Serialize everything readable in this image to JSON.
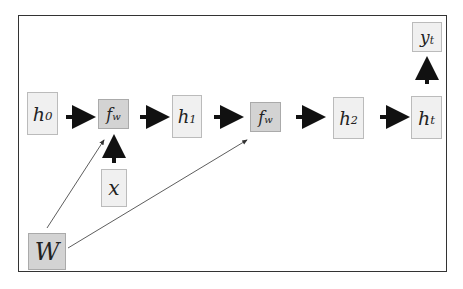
{
  "diagram": {
    "colors": {
      "frame": "#333333",
      "light_node": "#f0f0f0",
      "dark_node": "#d3d3d3",
      "arrow": "#111111"
    },
    "nodes": {
      "h0": {
        "base": "h",
        "sub": "0"
      },
      "fw1": {
        "base": "f",
        "sub": "w"
      },
      "h1": {
        "base": "h",
        "sub": "1"
      },
      "fw2": {
        "base": "f",
        "sub": "w"
      },
      "h2": {
        "base": "h",
        "sub": "2"
      },
      "ht": {
        "base": "h",
        "sub": "t"
      },
      "yt": {
        "base": "y",
        "sub": "t"
      },
      "x": {
        "base": "x",
        "sub": ""
      },
      "W": {
        "base": "W",
        "sub": ""
      }
    },
    "edges": [
      {
        "from": "h0",
        "to": "fw1",
        "style": "thick"
      },
      {
        "from": "fw1",
        "to": "h1",
        "style": "thick"
      },
      {
        "from": "h1",
        "to": "fw2",
        "style": "thick"
      },
      {
        "from": "fw2",
        "to": "h2",
        "style": "thick"
      },
      {
        "from": "h2",
        "to": "ht",
        "style": "thick"
      },
      {
        "from": "ht",
        "to": "yt",
        "style": "thick"
      },
      {
        "from": "x",
        "to": "fw1",
        "style": "thick"
      },
      {
        "from": "W",
        "to": "fw1",
        "style": "thin"
      },
      {
        "from": "W",
        "to": "fw2",
        "style": "thin"
      }
    ]
  }
}
